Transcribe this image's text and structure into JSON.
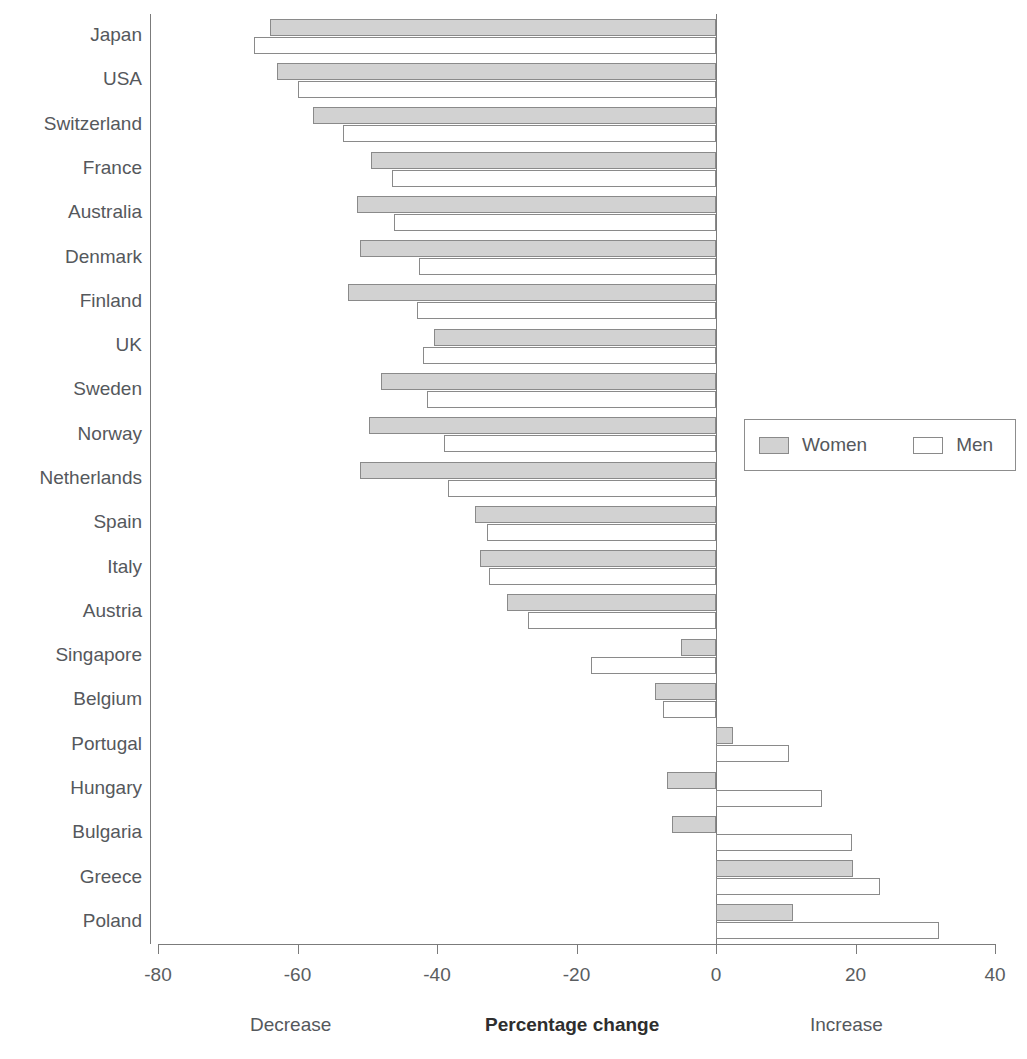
{
  "chart_data": {
    "type": "bar",
    "orientation": "horizontal",
    "title": "",
    "xlabel": "Percentage change",
    "ylabel": "",
    "xlim": [
      -80,
      40
    ],
    "xticks": [
      -80,
      -60,
      -40,
      -20,
      0,
      20,
      40
    ],
    "xtick_labels": [
      "-80",
      "-60",
      "-40",
      "-20",
      "0",
      "20",
      "40"
    ],
    "grid": false,
    "legend_position": "right-middle",
    "annotations": {
      "left": "Decrease",
      "center": "Percentage change",
      "right": "Increase"
    },
    "categories": [
      "Japan",
      "USA",
      "Switzerland",
      "France",
      "Australia",
      "Denmark",
      "Finland",
      "UK",
      "Sweden",
      "Norway",
      "Netherlands",
      "Spain",
      "Italy",
      "Austria",
      "Singapore",
      "Belgium",
      "Portugal",
      "Hungary",
      "Bulgaria",
      "Greece",
      "Poland"
    ],
    "series": [
      {
        "name": "Women",
        "color": "#d2d2d2",
        "values": [
          -64.0,
          -63.0,
          -57.8,
          -49.5,
          -51.5,
          -51.0,
          -52.8,
          -40.5,
          -48.0,
          -49.7,
          -51.0,
          -34.5,
          -33.8,
          -30.0,
          -5.0,
          -8.7,
          2.5,
          -7.0,
          -6.3,
          19.6,
          11.0
        ]
      },
      {
        "name": "Men",
        "color": "#ffffff",
        "values": [
          -66.3,
          -60.0,
          -53.5,
          -46.5,
          -46.2,
          -42.6,
          -42.8,
          -42.0,
          -41.5,
          -39.0,
          -38.4,
          -32.8,
          -32.5,
          -27.0,
          -17.9,
          -7.6,
          10.5,
          15.2,
          19.5,
          23.5,
          32.0
        ]
      }
    ]
  },
  "legend": {
    "items": [
      {
        "label": "Women",
        "swatch": "filled-gray-swatch"
      },
      {
        "label": "Men",
        "swatch": "outline-white-swatch"
      }
    ]
  }
}
